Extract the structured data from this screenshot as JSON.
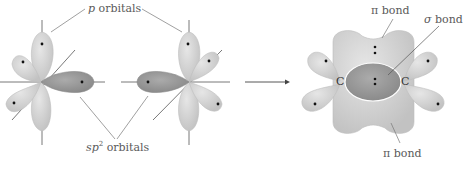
{
  "labels": {
    "p_orbitals_symbol": "p",
    "p_orbitals_text": " orbitals",
    "sp2_symbol": "sp",
    "sp2_sup": "2",
    "sp2_text": " orbitals",
    "pi_bond_top_symbol": "π",
    "pi_bond_top_text": " bond",
    "sigma_bond_symbol": "σ",
    "sigma_bond_text": " bond",
    "pi_bond_bottom_symbol": "π",
    "pi_bond_bottom_text": " bond",
    "carbon_left": "C",
    "carbon_right": "C"
  },
  "colors": {
    "p_lobe": "#d6d6d6",
    "sp2_lobe": "#9a9a9a",
    "sigma_region": "#a8a8a8",
    "axis": "#555555",
    "label": "#5a5a5a"
  }
}
